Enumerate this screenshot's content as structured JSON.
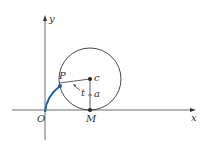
{
  "labels": {
    "y_axis": "y",
    "x_axis": "x",
    "origin": "O",
    "point_p": "P",
    "center": "c",
    "radius": "a",
    "angle": "t",
    "point_m": "M"
  },
  "colors": {
    "line": "#333333",
    "curve": "#1f5fa0"
  }
}
